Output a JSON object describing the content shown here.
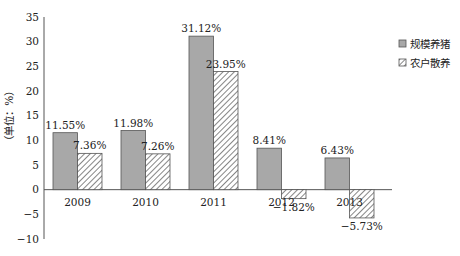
{
  "chart_data": {
    "type": "bar",
    "title": "",
    "xlabel": "",
    "ylabel": "（单位：%）",
    "ylim": [
      -10,
      35
    ],
    "yticks": [
      35,
      30,
      25,
      20,
      15,
      10,
      5,
      0,
      -5,
      -10
    ],
    "ytick_labels": [
      "35",
      "30",
      "25",
      "20",
      "15",
      "10",
      "5",
      "0",
      "−5",
      "−10"
    ],
    "grid": false,
    "legend_position": "right",
    "categories": [
      "2009",
      "2010",
      "2011",
      "2012",
      "2013"
    ],
    "series": [
      {
        "name": "规模养猪",
        "values": [
          11.55,
          11.98,
          31.12,
          8.41,
          6.43
        ],
        "labels": [
          "11.55%",
          "11.98%",
          "31.12%",
          "8.41%",
          "6.43%"
        ],
        "style": "solid-gray",
        "color": "#a8a8a8"
      },
      {
        "name": "农户散养",
        "values": [
          7.36,
          7.26,
          23.95,
          -1.82,
          -5.73
        ],
        "labels": [
          "7.36%",
          "7.26%",
          "23.95%",
          "−1.82%",
          "−5.73%"
        ],
        "style": "hatched",
        "color": "#555555"
      }
    ]
  }
}
